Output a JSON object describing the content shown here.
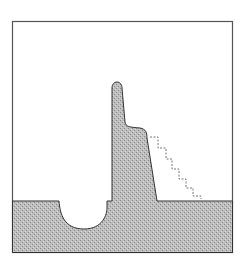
{
  "figure": {
    "colors": {
      "background": "#ffffff",
      "frame": "#555555",
      "fill": "#b8b8b8",
      "outline": "#333333",
      "dashed": "#777777"
    },
    "labels": []
  }
}
